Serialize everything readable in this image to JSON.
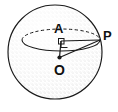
{
  "figure": {
    "type": "geometry-diagram",
    "background_color": "#ffffff",
    "stroke_color": "#1a1a1a",
    "label_color": "#101010",
    "shading": "stipple",
    "labels": [
      {
        "id": "A",
        "text": "A",
        "role": "center-of-small-circle"
      },
      {
        "id": "P",
        "text": "P",
        "role": "point-on-small-circle"
      },
      {
        "id": "O",
        "text": "O",
        "role": "center-of-sphere"
      }
    ],
    "points": [
      {
        "name": "A",
        "x": 61,
        "y": 41,
        "marked": true
      },
      {
        "name": "P",
        "x": 100,
        "y": 40,
        "marked": false
      },
      {
        "name": "O",
        "x": 59,
        "y": 58,
        "marked": true
      }
    ],
    "sphere": {
      "center_x": 55,
      "center_y": 52,
      "radius": 47
    },
    "cross_section": {
      "center_x": 61,
      "center_y": 40,
      "rx": 39,
      "ry": 11,
      "hidden_arc": "upper",
      "visible_arc": "lower"
    },
    "segments": [
      {
        "name": "OA",
        "from": "O",
        "to": "A",
        "style": "solid"
      },
      {
        "name": "AP",
        "from": "A",
        "to": "P",
        "style": "solid"
      },
      {
        "name": "OP",
        "from": "O",
        "to": "P",
        "style": "solid"
      }
    ],
    "right_angle_marker": {
      "at": "A",
      "between": [
        "OA",
        "AP"
      ],
      "size": 7
    }
  }
}
